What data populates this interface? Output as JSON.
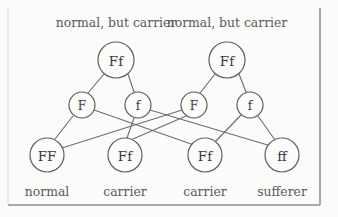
{
  "diagram": {
    "title_top_left": "normal, but carrier",
    "title_top_right": "normal, but carrier",
    "parents": [
      {
        "id": "parent-left",
        "genotype": "Ff",
        "cx": 116,
        "cy": 60,
        "r": 18
      },
      {
        "id": "parent-right",
        "genotype": "Ff",
        "cx": 227,
        "cy": 60,
        "r": 18
      }
    ],
    "gametes": [
      {
        "id": "gamete-left-F",
        "allele": "F",
        "cx": 82,
        "cy": 105,
        "r": 13
      },
      {
        "id": "gamete-left-f",
        "allele": "f",
        "cx": 138,
        "cy": 105,
        "r": 13
      },
      {
        "id": "gamete-right-F",
        "allele": "F",
        "cx": 194,
        "cy": 105,
        "r": 13
      },
      {
        "id": "gamete-right-f",
        "allele": "f",
        "cx": 250,
        "cy": 105,
        "r": 13
      }
    ],
    "offspring": [
      {
        "id": "offspring-FF",
        "genotype": "FF",
        "phenotype": "normal",
        "cx": 47,
        "cy": 155,
        "r": 17
      },
      {
        "id": "offspring-Ff-1",
        "genotype": "Ff",
        "phenotype": "carrier",
        "cx": 125,
        "cy": 155,
        "r": 17
      },
      {
        "id": "offspring-Ff-2",
        "genotype": "Ff",
        "phenotype": "carrier",
        "cx": 205,
        "cy": 155,
        "r": 17
      },
      {
        "id": "offspring-ff",
        "genotype": "ff",
        "phenotype": "sufferer",
        "cx": 282,
        "cy": 155,
        "r": 17
      }
    ],
    "top_labels": [
      {
        "text": "normal, but carrier",
        "x": 116,
        "y": 22
      },
      {
        "text": "normal, but carrier",
        "x": 227,
        "y": 22
      }
    ],
    "bottom_labels": [
      {
        "text": "normal",
        "x": 47,
        "y": 191
      },
      {
        "text": "carrier",
        "x": 125,
        "y": 191
      },
      {
        "text": "carrier",
        "x": 205,
        "y": 191
      },
      {
        "text": "sufferer",
        "x": 282,
        "y": 191
      }
    ],
    "edges": [
      {
        "name": "parent-left-to-F",
        "x1": 104,
        "y1": 74,
        "x2": 88,
        "y2": 93
      },
      {
        "name": "parent-left-to-f",
        "x1": 128,
        "y1": 74,
        "x2": 134,
        "y2": 92
      },
      {
        "name": "parent-right-to-F",
        "x1": 215,
        "y1": 74,
        "x2": 200,
        "y2": 93
      },
      {
        "name": "parent-right-to-f",
        "x1": 239,
        "y1": 74,
        "x2": 246,
        "y2": 92
      },
      {
        "name": "F-left-to-FF",
        "x1": 73,
        "y1": 116,
        "x2": 55,
        "y2": 139
      },
      {
        "name": "F-left-to-Ff-2",
        "x1": 94,
        "y1": 110,
        "x2": 194,
        "y2": 145
      },
      {
        "name": "f-left-to-Ff-1",
        "x1": 134,
        "y1": 118,
        "x2": 127,
        "y2": 138
      },
      {
        "name": "f-left-to-ff",
        "x1": 150,
        "y1": 110,
        "x2": 271,
        "y2": 146
      },
      {
        "name": "F-right-to-FF",
        "x1": 182,
        "y1": 110,
        "x2": 62,
        "y2": 148
      },
      {
        "name": "F-right-to-Ff-1",
        "x1": 186,
        "y1": 116,
        "x2": 133,
        "y2": 139
      },
      {
        "name": "f-right-to-Ff-2",
        "x1": 241,
        "y1": 115,
        "x2": 215,
        "y2": 142
      },
      {
        "name": "f-right-to-ff",
        "x1": 258,
        "y1": 116,
        "x2": 275,
        "y2": 140
      }
    ],
    "frame": {
      "right_border_x": 320,
      "bottom_border_y": 205
    },
    "colors": {
      "background": "#fbfbfa",
      "line": "#6e6e6e",
      "circle_stroke": "#5f5f5f",
      "circle_fill": "#fcfcfb",
      "text": "#3b3b3b",
      "caption": "#5a5a5a",
      "frame": "#a9a9a9"
    }
  }
}
